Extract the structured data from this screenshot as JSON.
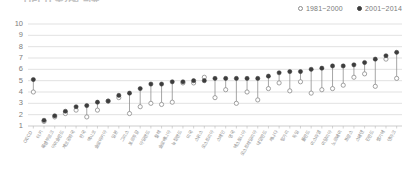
{
  "title": "OECD 국가별 평균",
  "legend": {
    "items": [
      {
        "label": "1981~2000",
        "marker": "open-circle",
        "color": "#ffffff"
      },
      {
        "label": "2001~2014",
        "marker": "filled-circle",
        "color": "#3d3d3d"
      }
    ]
  },
  "chart_data": {
    "type": "scatter",
    "subtype": "dumbbell",
    "title": "OECD 국가별 평균",
    "xlabel": "",
    "ylabel": "",
    "ylim": [
      1,
      10
    ],
    "yticks": [
      1,
      2,
      3,
      4,
      5,
      6,
      7,
      8,
      9,
      10
    ],
    "grid": true,
    "legend_position": "top-right",
    "sorted_by": "2001~2014 ascending",
    "categories": [
      "OECD",
      "터키",
      "룩셈부르크",
      "아이슬란드",
      "체코공화국",
      "한국",
      "멕시코",
      "슬로바키아",
      "일본",
      "그리스",
      "포르투갈",
      "아일랜드",
      "칠레",
      "슬로베니아",
      "뉴질랜드",
      "미국",
      "스위스",
      "오스트리아",
      "스페인",
      "영국",
      "에스토니아",
      "오스트레일리아",
      "네덜란드",
      "캐나다",
      "헝가리",
      "독일",
      "폴란드",
      "이스라엘",
      "이탈리아",
      "노르웨이",
      "프랑스",
      "스웨덴",
      "핀란드",
      "벨기에",
      "덴마크"
    ],
    "series": [
      {
        "name": "1981~2000",
        "marker": "open-circle",
        "values": [
          4.0,
          1.4,
          1.8,
          2.1,
          2.4,
          1.8,
          2.4,
          3.2,
          3.5,
          2.1,
          2.7,
          3.0,
          2.9,
          3.1,
          4.8,
          4.8,
          5.3,
          3.5,
          4.2,
          3.0,
          4.0,
          3.3,
          4.3,
          4.8,
          4.1,
          4.9,
          3.9,
          4.2,
          4.3,
          4.6,
          5.3,
          5.6,
          4.5,
          6.9,
          5.2
        ]
      },
      {
        "name": "2001~2014",
        "marker": "filled-circle",
        "values": [
          5.1,
          1.5,
          1.9,
          2.3,
          2.7,
          2.8,
          3.1,
          3.2,
          3.7,
          3.9,
          4.3,
          4.7,
          4.7,
          4.9,
          4.9,
          5.0,
          5.0,
          5.2,
          5.2,
          5.2,
          5.2,
          5.2,
          5.4,
          5.7,
          5.8,
          5.8,
          6.0,
          6.1,
          6.3,
          6.3,
          6.4,
          6.6,
          6.9,
          7.2,
          7.5
        ]
      }
    ]
  }
}
